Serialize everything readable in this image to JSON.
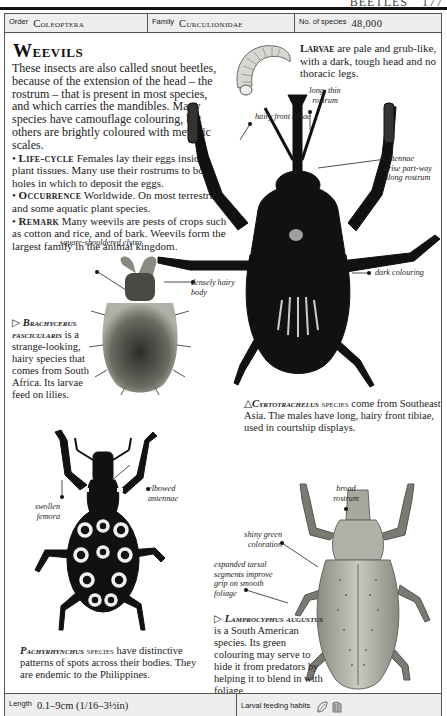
{
  "running_head": {
    "section": "BEETLES",
    "page": "177"
  },
  "info_bar": {
    "order_label": "Order",
    "order_value": "Coleoptera",
    "family_label": "Family",
    "family_value": "Curculionidae",
    "species_label": "No. of species",
    "species_value": "48,000"
  },
  "title": "Weevils",
  "intro": {
    "paragraph": "These insects are also called snout beetles, because of the extension of the head – the rostrum – that is present in most species, and which carries the mandibles. Many species have camouflage colouring, but others are brightly coloured with metallic scales.",
    "sections": [
      {
        "head": "Life-cycle",
        "text": "Females lay their eggs inside plant tissues. Many use their rostrums to bore holes in which to deposit the eggs."
      },
      {
        "head": "Occurrence",
        "text": "Worldwide. On most terrestrial and some aquatic plant species."
      },
      {
        "head": "Remark",
        "text": "Many weevils are pests of crops such as cotton and rice, and of bark. Weevils form the largest family in the animal kingdom."
      }
    ]
  },
  "larvae": {
    "head": "Larvae",
    "text": "are pale and grub-like, with a dark, tough head and no thoracic legs."
  },
  "annotations": {
    "hairy_front_tibiae": "hairy front tibiae",
    "long_thin_rostrum": "long, thin rostrum",
    "antennae_arise": "antennae arise part-way along rostrum",
    "dark_colouring": "dark colouring",
    "square_shouldered_elytra": "square-shouldered elytra",
    "densely_hairy_body": "densely hairy body",
    "elbowed_antennae": "elbowed antennae",
    "swollen_femora": "swollen femora",
    "broad_rostrum": "broad rostrum",
    "shiny_green": "shiny green coloration",
    "expanded_tarsal": "expanded tarsal segments improve grip on smooth foliage"
  },
  "captions": {
    "brachycerus": {
      "marker": "▷",
      "species": "Brachycerus fascicularis",
      "text": "is a strange-looking, hairy species that comes from South Africa. Its larvae feed on lilies."
    },
    "cyrtotrachelus": {
      "marker": "△",
      "species": "Cyrtotrachelus",
      "suffix": "species",
      "text": "come from Southeast Asia. The males have long, hairy front tibiae, used in courtship displays."
    },
    "pachyrhynchus": {
      "species": "Pachyrhynchus",
      "suffix": "species",
      "text": "have distinctive patterns of spots across their bodies. They are endemic to the Philippines."
    },
    "lamprocyphus": {
      "marker": "▷",
      "species": "Lamprocyphus augustus",
      "text": "is a South American species. Its green colouring may serve to hide it from predators by helping it to blend in with foliage."
    }
  },
  "bottom_bar": {
    "length_label": "Length",
    "length_value": "0.1–9cm (1/16–3½in)",
    "larval_label": "Larval feeding habits",
    "icons": [
      "leaf-icon",
      "bark-icon"
    ]
  }
}
